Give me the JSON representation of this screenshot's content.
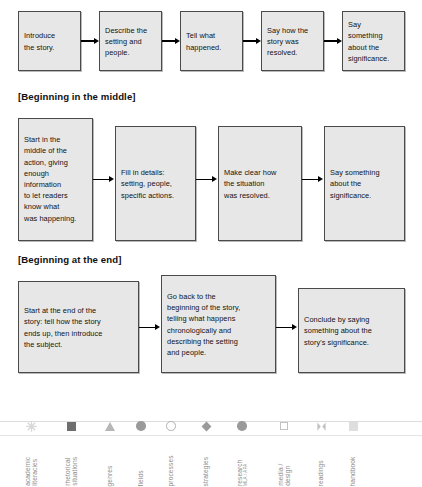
{
  "sections": [
    {
      "id": "chronological",
      "heading": "",
      "boxes": [
        {
          "text": "Introduce\nthe story."
        },
        {
          "text": "Describe the\nsetting and\npeople."
        },
        {
          "text": "Tell what\nhappened."
        },
        {
          "text": "Say how the\nstory was\nresolved."
        },
        {
          "text": "Say\nsomething\nabout the\nsignificance."
        }
      ]
    },
    {
      "id": "beginning-in-the-middle",
      "heading": "[Beginning in the middle]",
      "boxes": [
        {
          "text": "Start in the\nmiddle of the\naction, giving\nenough\ninformation\nto let readers\nknow what\nwas happening."
        },
        {
          "text": "Fill in details:\nsetting, people,\nspecific actions."
        },
        {
          "text": "Make clear how\nthe situation\nwas resolved."
        },
        {
          "text": "Say something\nabout the\nsignificance."
        }
      ]
    },
    {
      "id": "beginning-at-the-end",
      "heading": "[Beginning at the end]",
      "boxes": [
        {
          "text": "Start at the end of the\nstory: tell how the story\nends up, then introduce\nthe subject."
        },
        {
          "text": "Go back to the\nbeginning of the story,\ntelling what happens\nchronologically and\ndescribing the setting\nand people."
        },
        {
          "text": "Conclude by saying\nsomething about the\nstory's significance."
        }
      ]
    }
  ],
  "legend": {
    "items": [
      {
        "label": "academic",
        "label2": "literacies",
        "sub": "",
        "icon": "star-icon",
        "color": "#d8d8d8"
      },
      {
        "label": "rhetorical",
        "label2": "situations",
        "sub": "",
        "icon": "square-filled-icon",
        "color": "#6e6e6e"
      },
      {
        "label": "genres",
        "label2": "",
        "sub": "",
        "icon": "triangle-icon",
        "color": "#b6b6b6"
      },
      {
        "label": "fields",
        "label2": "",
        "sub": "",
        "icon": "circle-filled-icon",
        "color": "#9a9a9a"
      },
      {
        "label": "processes",
        "label2": "",
        "sub": "",
        "icon": "circle-open-icon",
        "color": "#b0b0b0"
      },
      {
        "label": "strategies",
        "label2": "",
        "sub": "",
        "icon": "diamond-icon",
        "color": "#9a9a9a"
      },
      {
        "label": "research",
        "label2": "",
        "sub": "MLA / APA",
        "icon": "circle-filled-icon",
        "color": "#9a9a9a"
      },
      {
        "label": "media /",
        "label2": "design",
        "sub": "",
        "icon": "square-open-icon",
        "color": "#c2c2c2"
      },
      {
        "label": "readings",
        "label2": "",
        "sub": "",
        "icon": "bowtie-icon",
        "color": "#c2c2c2"
      },
      {
        "label": "handbook",
        "label2": "",
        "sub": "",
        "icon": "square-light-icon",
        "color": "#dedede"
      }
    ]
  },
  "colors": {
    "box_fill": "#e7e7e7",
    "box_border": "#4a4a4a",
    "arrow": "#000000",
    "heading": "#111111",
    "legend_label": "#8d8d8d"
  }
}
